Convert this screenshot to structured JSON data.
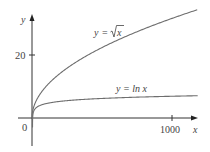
{
  "chart_data": {
    "type": "line",
    "title": "",
    "xlabel": "x",
    "ylabel": "y",
    "x_ticks": [
      {
        "value": 1000,
        "label": "1000"
      }
    ],
    "y_ticks": [
      {
        "value": 20,
        "label": "20"
      }
    ],
    "origin_label": "0",
    "xlim": [
      0,
      1180
    ],
    "ylim": [
      -8,
      34
    ],
    "grid": false,
    "legend": "none (inline curve labels)",
    "series": [
      {
        "name": "y = √x",
        "label_prefix": "y = ",
        "label_radical": "x",
        "function": "sqrt",
        "x": [
          0,
          10,
          50,
          100,
          200,
          400,
          600,
          800,
          1000,
          1180
        ],
        "values": [
          0,
          3.16,
          7.07,
          10,
          14.14,
          20,
          24.49,
          28.28,
          31.62,
          34.35
        ]
      },
      {
        "name": "y = ln x",
        "label": "y = ln x",
        "function": "ln",
        "x": [
          1,
          5,
          10,
          50,
          100,
          200,
          400,
          600,
          800,
          1000,
          1180
        ],
        "values": [
          0,
          1.61,
          2.3,
          3.91,
          4.61,
          5.3,
          5.99,
          6.4,
          6.68,
          6.91,
          7.07
        ]
      }
    ],
    "colors": {
      "curves": "#6e6e6e",
      "axes": "#333333",
      "text": "#444444"
    }
  }
}
